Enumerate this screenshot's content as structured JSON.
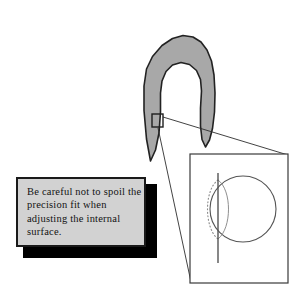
{
  "figure": {
    "background_color": "#ffffff"
  },
  "note": {
    "text": "Be careful not to spoil the precision fit when adjusting the internal surface.",
    "fill_color": "#d2d2d2",
    "border_color": "#1a1a1a",
    "shadow_color": "#000000",
    "text_color": "#121212"
  },
  "part": {
    "name": "clip-shaped-component",
    "fill_color": "#a8a8a8",
    "outline_color": "#222222",
    "outline_path": "M150.5 161.0 L146.5 139.0 L144.0 110.5 L144.0 86.0 L146.5 69.0 L152.5 56.5 L162.0 45.5 L172.5 38.5 L183.0 35.5 L193.0 37.0 L201.0 42.0 L207.0 50.0 L211.5 61.0 L214.0 75.0 L215.0 93.0 L214.5 112.0 L212.5 128.5 L209.5 140.0 L205.5 147.0 L202.0 139.5 L200.5 126.0 L200.5 108.0 L201.5 91.0 L200.5 79.5 L196.5 70.5 L189.5 64.5 L181.0 62.5 L172.5 65.0 L166.0 71.5 L162.0 81.0 L160.5 93.0 L160.5 112.0 L159.0 133.0 L155.5 150.0 Z",
    "callout_marker": {
      "name": "detail-marker-rect",
      "x": 152,
      "y": 114,
      "width": 11,
      "height": 13
    }
  },
  "detail_panel": {
    "name": "magnified-detail-view",
    "x": 190,
    "y": 154,
    "width": 98,
    "height": 129,
    "border_color": "#3a3a3a",
    "fill_color": "#ffffff",
    "circle": {
      "cx": 243,
      "cy": 209,
      "r": 33,
      "stroke": "#555555"
    },
    "vertical_line": {
      "x": 218,
      "y1": 173,
      "y2": 263,
      "stroke": "#555555"
    },
    "dotted_arc_stroke": "#8a8a8a"
  },
  "leader_lines": {
    "name": "callout-leader-lines",
    "stroke": "#2e2e2e",
    "segments": [
      {
        "x1": 163,
        "y1": 117,
        "x2": 288,
        "y2": 155
      },
      {
        "x1": 158,
        "y1": 128,
        "x2": 191,
        "y2": 282
      }
    ]
  }
}
